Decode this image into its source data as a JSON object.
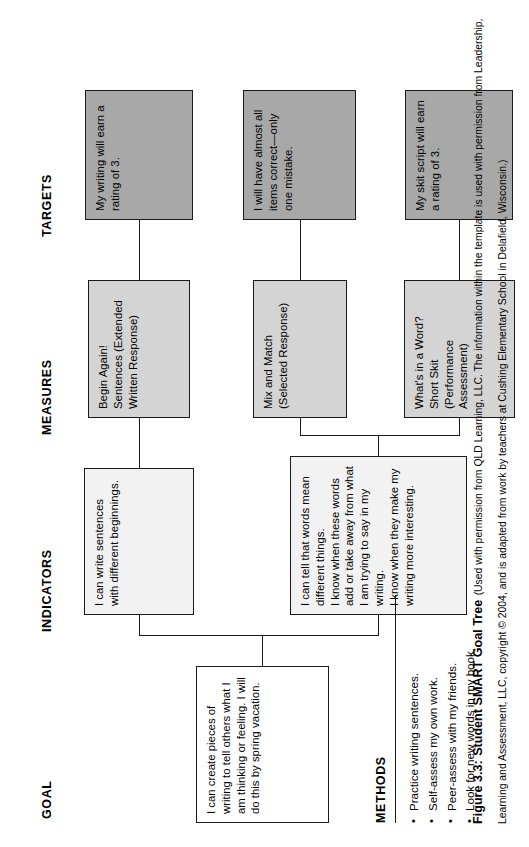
{
  "figure": {
    "number": "Figure 3.3:",
    "title": "Student SMART Goal Tree",
    "credit": "(Used with permission from QLD Learning, LLC. The information within the template is used with permission from Leadership, Learning and Assessment, LLC, copyright © 2004, and is adapted from work by teachers at Cushing Elementary School in Delafield, Wisconsin.)"
  },
  "columns": {
    "goal": "GOAL",
    "indicators": "INDICATORS",
    "measures": "MEASURES",
    "targets": "TARGETS"
  },
  "goal": {
    "text": "I can create pieces of writing to tell others what I am thinking or feeling. I will do this by spring vacation."
  },
  "indicators": [
    {
      "text": "I can write sentences with different beginnings."
    },
    {
      "text": "I can tell that words mean different things.\nI know when these words add or take away from what I am trying to say in my writing.\nI know when they make my writing more interesting."
    }
  ],
  "measures": [
    {
      "text": "Begin Again! Sentences (Extended Written Response)"
    },
    {
      "text": "Mix and Match (Selected Response)"
    },
    {
      "text": "What's in a Word? Short Skit (Performance Assessment)"
    }
  ],
  "targets": [
    {
      "text": "My writing will earn a rating of 3."
    },
    {
      "text": "I will have almost all items correct—only one mistake."
    },
    {
      "text": "My skit script will earn a rating of 3."
    }
  ],
  "methods": {
    "title": "METHODS",
    "bullet_glyph": "•",
    "items": [
      "Practice writing sentences.",
      "Self-assess my own work.",
      "Peer-assess with my friends.",
      "Look for new words in my book."
    ]
  },
  "colors": {
    "goal_fill": "#ffffff",
    "indicator_fill": "#f2f2f2",
    "measure_fill": "#d4d4d4",
    "target_fill": "#a8a8a8",
    "stroke": "#1a1a1a"
  }
}
